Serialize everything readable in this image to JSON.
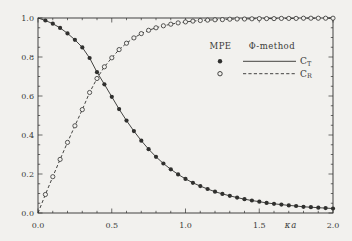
{
  "colors": {
    "ink": "#30302e",
    "background": "#f2f1ee"
  },
  "chart_data": {
    "type": "line",
    "title": "",
    "xlabel": "κa",
    "ylabel": "",
    "xlim": [
      0.0,
      2.0
    ],
    "ylim": [
      0.0,
      1.0
    ],
    "grid": false,
    "frame": "box-with-mirrored-inward-ticks",
    "x_major_ticks": [
      0.0,
      0.5,
      1.0,
      1.5,
      2.0
    ],
    "x_tick_labels": [
      "0.0",
      "0.5",
      "1.0",
      "1.5",
      "2.0"
    ],
    "x_minor_step": 0.1,
    "y_major_ticks": [
      0.0,
      0.2,
      0.4,
      0.6,
      0.8,
      1.0
    ],
    "y_tick_labels": [
      "0.0",
      "0.2",
      "0.4",
      "0.6",
      "0.8",
      "1.0"
    ],
    "y_minor_step": 0.05,
    "legend": {
      "position": "upper-right-inside",
      "col1_header": "MPE",
      "col2_header": "Φ-method",
      "rows": [
        {
          "marker": "filled-circle",
          "line": "solid",
          "label_main": "C",
          "label_sub": "T"
        },
        {
          "marker": "open-circle",
          "line": "dashed",
          "label_main": "C",
          "label_sub": "R"
        }
      ]
    },
    "x": [
      0.05,
      0.1,
      0.15,
      0.2,
      0.25,
      0.3,
      0.35,
      0.4,
      0.45,
      0.5,
      0.55,
      0.6,
      0.65,
      0.7,
      0.75,
      0.8,
      0.85,
      0.9,
      0.95,
      1.0,
      1.05,
      1.1,
      1.15,
      1.2,
      1.25,
      1.3,
      1.35,
      1.4,
      1.45,
      1.5,
      1.55,
      1.6,
      1.65,
      1.7,
      1.75,
      1.8,
      1.85,
      1.9,
      1.95,
      2.0
    ],
    "series": [
      {
        "name": "C_T",
        "method_markers": "MPE",
        "method_line": "Φ-method",
        "marker": "filled-circle",
        "line": "solid",
        "start_y": 1.0,
        "values": [
          0.987,
          0.971,
          0.949,
          0.921,
          0.888,
          0.849,
          0.795,
          0.722,
          0.66,
          0.596,
          0.533,
          0.474,
          0.42,
          0.371,
          0.327,
          0.288,
          0.254,
          0.224,
          0.198,
          0.175,
          0.155,
          0.138,
          0.123,
          0.109,
          0.098,
          0.088,
          0.079,
          0.071,
          0.064,
          0.058,
          0.052,
          0.047,
          0.043,
          0.039,
          0.036,
          0.032,
          0.03,
          0.027,
          0.025,
          0.023
        ]
      },
      {
        "name": "C_R",
        "method_markers": "MPE",
        "method_line": "Φ-method",
        "marker": "open-circle",
        "line": "dashed",
        "start_y": 0.0,
        "values": [
          0.095,
          0.186,
          0.275,
          0.362,
          0.447,
          0.53,
          0.618,
          0.69,
          0.75,
          0.796,
          0.838,
          0.871,
          0.898,
          0.92,
          0.937,
          0.95,
          0.96,
          0.968,
          0.975,
          0.98,
          0.984,
          0.987,
          0.989,
          0.991,
          0.992,
          0.994,
          0.995,
          0.995,
          0.996,
          0.997,
          0.997,
          0.997,
          0.998,
          0.998,
          0.998,
          0.999,
          0.999,
          0.999,
          0.999,
          0.999
        ]
      }
    ]
  }
}
